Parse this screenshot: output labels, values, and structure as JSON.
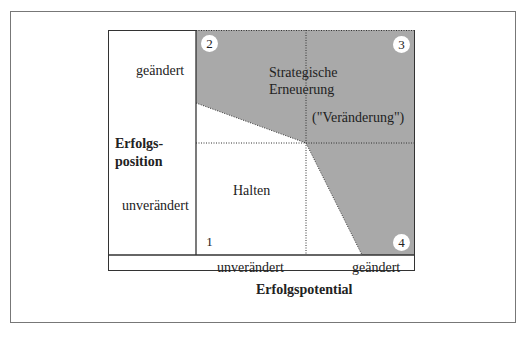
{
  "diagram": {
    "y_axis": {
      "title_line1": "Erfolgs-",
      "title_line2": "position",
      "tick_high": "geändert",
      "tick_low": "unverändert"
    },
    "x_axis": {
      "title": "Erfolgspotential",
      "tick_low": "unverändert",
      "tick_high": "geändert"
    },
    "regions": {
      "strategic_line1": "Strategische",
      "strategic_line2": "Erneuerung",
      "change": "(\"Veränderung\")",
      "hold": "Halten"
    },
    "quadrant_numbers": {
      "q1": "1",
      "q2": "2",
      "q3": "3",
      "q4": "4"
    },
    "colors": {
      "shaded": "#a9a9a9",
      "line": "#333333"
    }
  }
}
